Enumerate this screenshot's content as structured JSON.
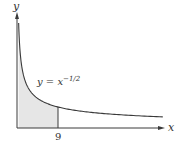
{
  "chart_data": {
    "type": "area",
    "title": "",
    "function": "y = x^(-1/2)",
    "curve_label": {
      "lhs": "y = x",
      "exponent": "−1/2"
    },
    "xlabel": "x",
    "ylabel": "y",
    "x_ticks": [
      {
        "value": 9,
        "label": "9"
      }
    ],
    "shaded_region": {
      "from": 0,
      "to": 9
    },
    "xlim": [
      0,
      32
    ],
    "ylim": [
      0,
      1.7
    ],
    "grid": false,
    "legend": "none",
    "colors": {
      "curve": "#3a3a3a",
      "fill": "#e6e6e6",
      "axis": "#3a3a3a"
    },
    "sample_points": [
      {
        "x": 0.36,
        "y": 1.67
      },
      {
        "x": 1,
        "y": 1.0
      },
      {
        "x": 4,
        "y": 0.5
      },
      {
        "x": 9,
        "y": 0.333
      },
      {
        "x": 16,
        "y": 0.25
      },
      {
        "x": 25,
        "y": 0.2
      },
      {
        "x": 32,
        "y": 0.177
      }
    ]
  },
  "labels": {
    "x_axis": "x",
    "y_axis": "y",
    "tick_9": "9",
    "curve_eq": "y = x",
    "curve_exp": "−1/2"
  }
}
